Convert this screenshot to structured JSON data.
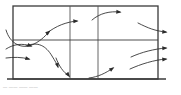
{
  "figure": {
    "name": "grid-flow-diagram",
    "caption": "— —— —— ——",
    "colors": {
      "grid_stroke": "#3a3a3a",
      "inner_stroke": "#555555",
      "arrow_stroke": "#2b2b2b",
      "background": "#ffffff",
      "caption_text": "#8a8a8a"
    },
    "grid": {
      "left": 13,
      "right": 158,
      "top": 6,
      "bottom": 79,
      "columns": 3,
      "rows": 2,
      "vertical_dividers": [
        70,
        98
      ],
      "horizontal_dividers": [
        40
      ],
      "outer_stroke_width": 1.3,
      "inner_stroke_width": 0.9,
      "bottom_extends_left": 6,
      "bottom_extends_right": 8
    },
    "arrows": [
      {
        "id": "arrow-in-top-left",
        "label": "inflow-top-left",
        "path": "M 6 30 C 10 44 22 50 34 44 C 42 40 46 35 50 31",
        "head": {
          "x": 50.5,
          "y": 30.6,
          "angle": -38
        }
      },
      {
        "id": "arrow-top-mid-left",
        "label": "flow-top-row-left-to-center",
        "path": "M 47 33 C 56 26 66 22 77 21",
        "head": {
          "x": 78.5,
          "y": 21,
          "angle": -4
        }
      },
      {
        "id": "arrow-top-mid-right",
        "label": "flow-top-row-center-to-right",
        "path": "M 92 20 C 100 13 110 11 120 12",
        "head": {
          "x": 121.5,
          "y": 12.2,
          "angle": 6
        }
      },
      {
        "id": "arrow-out-top-right",
        "label": "outflow-top-right",
        "path": "M 138 23 C 148 28 155 31 166 32",
        "head": {
          "x": 167.5,
          "y": 32.2,
          "angle": 6
        }
      },
      {
        "id": "arrow-in-mid-upper",
        "label": "inflow-middle-upper",
        "path": "M 6 49 C 14 44 22 43 31 46",
        "head": {
          "x": 32.5,
          "y": 46.6,
          "angle": 20
        }
      },
      {
        "id": "arrow-recirc-loop",
        "label": "recirculation-s-curve",
        "path": "M 26 46 C 38 41 46 46 52 56 C 55 61 57 64 58 67",
        "head": {
          "x": 58.3,
          "y": 68.3,
          "angle": 74
        }
      },
      {
        "id": "arrow-in-mid-lower",
        "label": "inflow-middle-lower",
        "path": "M 6 58 C 14 57 21 57 29 59",
        "head": {
          "x": 30.5,
          "y": 59.4,
          "angle": 14
        }
      },
      {
        "id": "arrow-down-to-floor",
        "label": "downflow-to-bottom-boundary",
        "path": "M 56 58 C 59 66 63 72 69 76",
        "head": {
          "x": 70,
          "y": 77.2,
          "angle": 52
        }
      },
      {
        "id": "arrow-up-bottom-center",
        "label": "upflow-bottom-center",
        "path": "M 89 78 C 98 77 106 73 113 68",
        "head": {
          "x": 114.3,
          "y": 67.2,
          "angle": -34
        }
      },
      {
        "id": "arrow-out-mid-upper",
        "label": "outflow-middle-upper",
        "path": "M 131 57 C 142 52 154 49 166 48",
        "head": {
          "x": 167.5,
          "y": 48,
          "angle": -4
        }
      },
      {
        "id": "arrow-out-mid-lower",
        "label": "outflow-middle-lower",
        "path": "M 130 69 C 141 64 154 60 166 59",
        "head": {
          "x": 167.5,
          "y": 59,
          "angle": -5
        }
      }
    ]
  }
}
